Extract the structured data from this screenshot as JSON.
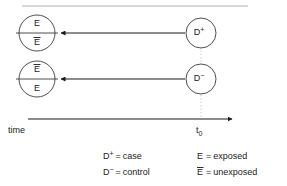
{
  "figure": {
    "title_rule": "horizontal-rule",
    "time_axis": {
      "label": "time",
      "marker_label_base": "t",
      "marker_label_sub": "0"
    },
    "nodes": {
      "outcome_top": {
        "name": "exposed-over-unexposed",
        "numerator": "E",
        "denominator": "E",
        "numerator_barred": false,
        "denominator_barred": true
      },
      "outcome_bottom": {
        "name": "unexposed-over-exposed",
        "numerator": "E",
        "denominator": "E",
        "numerator_barred": true,
        "denominator_barred": false
      },
      "source_top": {
        "name": "case-node",
        "base": "D",
        "sign": "+"
      },
      "source_bottom": {
        "name": "control-node",
        "base": "D",
        "sign": "−"
      }
    },
    "legend": {
      "left": [
        {
          "symbol_base": "D",
          "symbol_sign": "+",
          "symbol_barred": false,
          "equals": "=",
          "meaning": "case"
        },
        {
          "symbol_base": "D",
          "symbol_sign": "−",
          "symbol_barred": false,
          "equals": "=",
          "meaning": "control"
        }
      ],
      "right": [
        {
          "symbol_base": "E",
          "symbol_sign": "",
          "symbol_barred": false,
          "equals": "=",
          "meaning": "exposed"
        },
        {
          "symbol_base": "E",
          "symbol_sign": "",
          "symbol_barred": true,
          "equals": "=",
          "meaning": "unexposed"
        }
      ]
    },
    "colors": {
      "stroke_dark": "#1a1a1a",
      "stroke_circle": "#3a3a3a",
      "stroke_guide": "#b8b8b8",
      "stroke_rule": "#9a9a9a",
      "background": "#ffffff"
    }
  }
}
